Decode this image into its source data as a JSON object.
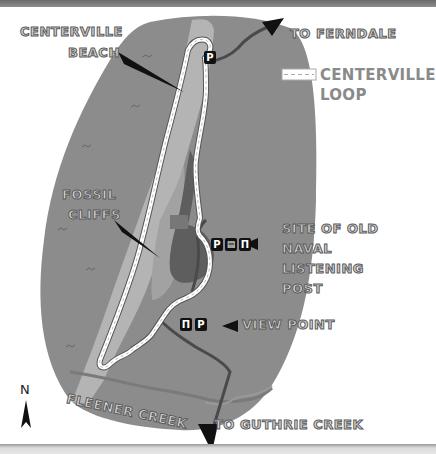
{
  "map": {
    "title_labels": {
      "beach": [
        "CENTERVILLE",
        "BEACH"
      ],
      "ferndale": "TO FERNDALE",
      "fossil_cliffs": [
        "FOSSIL",
        "CLIFFS"
      ],
      "naval_post": [
        "SITE OF OLD",
        "NAVAL",
        "LISTENING",
        "POST"
      ],
      "view_point": "VIEW POINT",
      "fleener_creek": "FLEENER CREEK",
      "guthrie_creek": "TO GUTHRIE CREEK"
    },
    "legend": {
      "loop_label_line1": "CENTERVILLE",
      "loop_label_line2": "LOOP",
      "loop_symbol": "dashed-trail-line"
    },
    "compass": {
      "label": "N",
      "icon": "north-arrow-icon"
    },
    "symbols": {
      "parking": "P",
      "restroom": "restroom-icon",
      "picnic": "picnic-table-icon"
    },
    "colors": {
      "headland": "#8c8c8c",
      "beach_strip": "#b4b4b4",
      "forest": "#5e5e5e",
      "trail": "#ffffff",
      "road": "#4a4a4a",
      "creek": "#7a7a7a",
      "label_fill": "#d8d8d8",
      "label_stroke": "#5a5a5a",
      "legend_text": "#8a8a8a"
    }
  }
}
